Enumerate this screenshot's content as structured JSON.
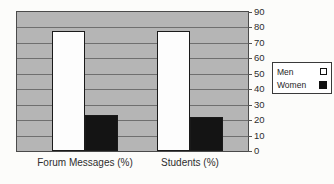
{
  "chart_data": {
    "type": "bar",
    "title": "",
    "xlabel": "",
    "ylabel": "",
    "categories": [
      "Forum Messages (%)",
      "Students (%)"
    ],
    "series": [
      {
        "name": "Men",
        "values": [
          78,
          78
        ],
        "fill": "#fdfdfd",
        "marker": "hollow-square"
      },
      {
        "name": "Women",
        "values": [
          23,
          22
        ],
        "fill": "#141414",
        "marker": "filled-square"
      }
    ],
    "ylim": [
      0,
      90
    ],
    "yticks": [
      0,
      10,
      20,
      30,
      40,
      50,
      60,
      70,
      80,
      90
    ],
    "grid": "horizontal",
    "legend_position": "right",
    "plot_background": "#b5b5b5"
  },
  "colors": {
    "plot_bg": "#b5b5b5",
    "gridline": "#6f6f6f",
    "plot_border": "#4a4a4a",
    "bar_outline": "#1a1a1a",
    "text": "#2e2e2e",
    "canvas_bg": "#fcfcfa",
    "legend_bg": "#ffffff",
    "legend_border": "#3a3a3a"
  }
}
